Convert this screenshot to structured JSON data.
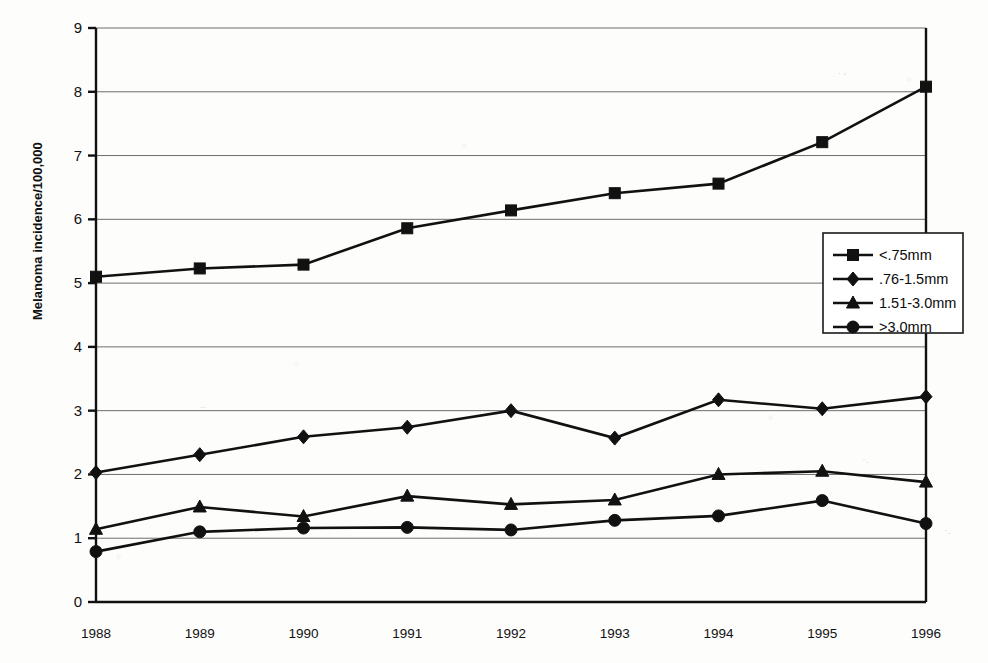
{
  "chart_data": {
    "type": "line",
    "title": "",
    "xlabel": "",
    "ylabel": "Melanoma incidence/100,000",
    "categories": [
      "1988",
      "1989",
      "1990",
      "1991",
      "1992",
      "1993",
      "1994",
      "1995",
      "1996"
    ],
    "x": [
      1988,
      1989,
      1990,
      1991,
      1992,
      1993,
      1994,
      1995,
      1996
    ],
    "xlim": [
      1988,
      1996
    ],
    "ylim": [
      0,
      9
    ],
    "yticks": [
      "0",
      "1",
      "2",
      "3",
      "4",
      "5",
      "6",
      "7",
      "8",
      "9"
    ],
    "grid": true,
    "legend_position": "upper-right-inside",
    "series": [
      {
        "name": "<.75mm",
        "marker": "square",
        "values": [
          5.1,
          5.23,
          5.29,
          5.86,
          6.14,
          6.41,
          6.56,
          7.21,
          8.08
        ]
      },
      {
        "name": ".76-1.5mm",
        "marker": "diamond",
        "values": [
          2.03,
          2.31,
          2.59,
          2.74,
          3.0,
          2.57,
          3.17,
          3.03,
          3.22
        ]
      },
      {
        "name": "1.51-3.0mm",
        "marker": "triangle",
        "values": [
          1.14,
          1.49,
          1.34,
          1.66,
          1.53,
          1.6,
          2.0,
          2.05,
          1.88
        ]
      },
      {
        "name": ">3.0mm",
        "marker": "circle",
        "values": [
          0.79,
          1.1,
          1.16,
          1.17,
          1.13,
          1.28,
          1.35,
          1.59,
          1.23
        ]
      }
    ],
    "colors": {
      "series": "#111111",
      "grid": "#6e6e6e",
      "axis": "#111111",
      "background": "#ffffff"
    }
  },
  "axis": {
    "y_label": "Melanoma incidence/100,000",
    "y_ticks": [
      "9",
      "8",
      "7",
      "6",
      "5",
      "4",
      "3",
      "2",
      "1",
      "0"
    ],
    "x_ticks": [
      "1988",
      "1989",
      "1990",
      "1991",
      "1992",
      "1993",
      "1994",
      "1995",
      "1996"
    ]
  },
  "legend": {
    "entries": [
      {
        "label": "<.75mm",
        "marker": "square"
      },
      {
        "label": ".76-1.5mm",
        "marker": "diamond"
      },
      {
        "label": "1.51-3.0mm",
        "marker": "triangle"
      },
      {
        "label": ">3.0mm",
        "marker": "circle"
      }
    ]
  }
}
